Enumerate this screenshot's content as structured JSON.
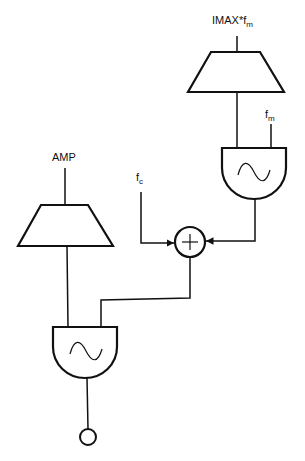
{
  "diagram": {
    "type": "FM synthesis unit-generator patch",
    "colors": {
      "stroke": "#111111",
      "background": "#ffffff"
    },
    "nodes": {
      "mod_amp_input": {
        "label": "IMAX*f",
        "sub": "m"
      },
      "mod_freq_input": {
        "label": "f",
        "sub": "m"
      },
      "carrier_freq_input": {
        "label": "f",
        "sub": "c"
      },
      "carrier_amp_input": {
        "label": "AMP"
      },
      "modulator_envelope": {
        "shape": "trapezoid",
        "icon": "envelope-icon"
      },
      "modulator_oscillator": {
        "shape": "oscillator",
        "icon": "sine-wave-icon"
      },
      "adder": {
        "shape": "circle",
        "icon": "plus-icon"
      },
      "carrier_envelope": {
        "shape": "trapezoid",
        "icon": "envelope-icon"
      },
      "carrier_oscillator": {
        "shape": "oscillator",
        "icon": "sine-wave-icon"
      },
      "output": {
        "shape": "small-circle",
        "icon": "output-icon"
      }
    },
    "edges": [
      [
        "mod_amp_input",
        "modulator_envelope"
      ],
      [
        "modulator_envelope",
        "modulator_oscillator"
      ],
      [
        "mod_freq_input",
        "modulator_oscillator"
      ],
      [
        "modulator_oscillator",
        "adder"
      ],
      [
        "carrier_freq_input",
        "adder"
      ],
      [
        "carrier_amp_input",
        "carrier_envelope"
      ],
      [
        "carrier_envelope",
        "carrier_oscillator"
      ],
      [
        "adder",
        "carrier_oscillator"
      ],
      [
        "carrier_oscillator",
        "output"
      ]
    ]
  }
}
